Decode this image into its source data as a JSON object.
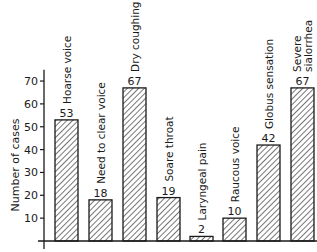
{
  "chart_data": {
    "type": "bar",
    "title": "",
    "xlabel": "",
    "ylabel": "Number of cases",
    "ylim": [
      0,
      75
    ],
    "yticks": [
      10,
      20,
      30,
      40,
      50,
      60,
      70
    ],
    "grid": false,
    "legend": null,
    "bar_fill": "diagonal-hatch",
    "categories": [
      "Hoarse voice",
      "Need to clear voice",
      "Dry coughing",
      "Soare throat",
      "Laryngeal pain",
      "Raucous voice",
      "Globus sensation",
      "Severe sialorrhea"
    ],
    "category_lines": [
      [
        "Hoarse voice"
      ],
      [
        "Need to clear voice"
      ],
      [
        "Dry coughing"
      ],
      [
        "Soare throat"
      ],
      [
        "Laryngeal pain"
      ],
      [
        "Raucous voice"
      ],
      [
        "Globus sensation"
      ],
      [
        "Severe",
        "sialorrhea"
      ]
    ],
    "values": [
      53,
      18,
      67,
      19,
      2,
      10,
      42,
      67
    ],
    "colors": {
      "ink": "#1a1a1a",
      "background": "#ffffff"
    }
  }
}
